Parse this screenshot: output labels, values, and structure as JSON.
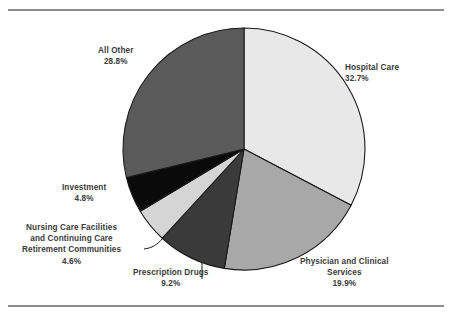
{
  "chart_data": {
    "type": "pie",
    "title": "",
    "subtitle": "",
    "xlabel": "",
    "ylabel": "",
    "legend_position": "none",
    "grid": false,
    "units": "percent",
    "total": 100.0,
    "start_angle_deg": 0,
    "direction": "clockwise",
    "categories": [
      "Hospital Care",
      "Physician and Clinical Services",
      "Prescription Drugs",
      "Nursing Care Facilities and Continuing Care Retirement Communities",
      "Investment",
      "All Other"
    ],
    "values": [
      32.7,
      19.9,
      9.2,
      4.6,
      4.8,
      28.8
    ],
    "slices": [
      {
        "key": "hospital-care",
        "label": "Hospital Care",
        "label_lines": [
          "Hospital Care"
        ],
        "value": 32.7,
        "value_text": "32.7%",
        "color": "#e8e8e8",
        "leader": false
      },
      {
        "key": "physician-and-clinical-services",
        "label": "Physician and Clinical Services",
        "label_lines": [
          "Physician and Clinical",
          "Services"
        ],
        "value": 19.9,
        "value_text": "19.9%",
        "color": "#a8a8a8",
        "leader": false
      },
      {
        "key": "prescription-drugs",
        "label": "Prescription Drugs",
        "label_lines": [
          "Prescription Drugs"
        ],
        "value": 9.2,
        "value_text": "9.2%",
        "color": "#3a3a3a",
        "leader": true
      },
      {
        "key": "nursing-care-facilities",
        "label": "Nursing Care Facilities and Continuing Care Retirement Communities",
        "label_lines": [
          "Nursing Care Facilities",
          "and Continuing Care",
          "Retirement Communities"
        ],
        "value": 4.6,
        "value_text": "4.6%",
        "color": "#d5d5d5",
        "leader": true
      },
      {
        "key": "investment",
        "label": "Investment",
        "label_lines": [
          "Investment"
        ],
        "value": 4.8,
        "value_text": "4.8%",
        "color": "#0a0a0a",
        "leader": false
      },
      {
        "key": "all-other",
        "label": "All Other",
        "label_lines": [
          "All Other"
        ],
        "value": 28.8,
        "value_text": "28.8%",
        "color": "#5a5a5a",
        "leader": false
      }
    ]
  },
  "style": {
    "rule_color": "#8d8d8d",
    "slice_outline_color": "#1a1a1a",
    "background": "#ffffff",
    "text_color": "#3a3a3a"
  }
}
